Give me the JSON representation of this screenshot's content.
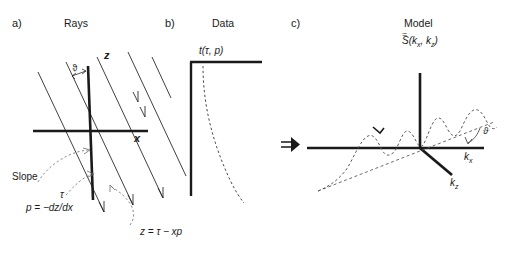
{
  "figure": {
    "background_color": "#ffffff",
    "line_color": "#1a1a1a",
    "dashed_color": "#555555"
  },
  "panels": {
    "a": {
      "letter": "a)",
      "title": "Rays",
      "axis_z": "z",
      "axis_x": "x",
      "angle_symbol": "ϑ",
      "slope_label": "Slope",
      "tau_label": "τ",
      "slope_formula": "p = −dz/dx",
      "ray_formula": "z = τ − xp"
    },
    "b": {
      "letter": "b)",
      "title": "Data",
      "function_label": "t(τ, p)"
    },
    "c": {
      "letter": "c)",
      "title": "Model",
      "function_label_base": "S",
      "function_label_accent": "=",
      "function_label_args_open": "(",
      "function_label_kx": "k",
      "function_label_kx_sub": "x",
      "function_label_comma": ", ",
      "function_label_kz": "k",
      "function_label_kz_sub": "z",
      "function_label_args_close": ")",
      "axis_kx": "k",
      "axis_kx_sub": "x",
      "axis_kz": "k",
      "axis_kz_sub": "z",
      "angle_symbol": "ϑ",
      "transform_arrow": "⇒"
    }
  }
}
